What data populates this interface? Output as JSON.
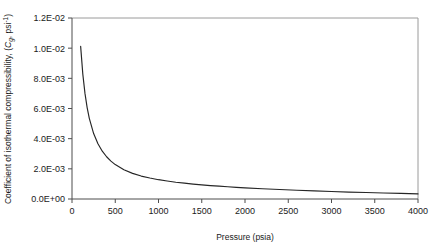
{
  "chart_data": {
    "type": "line",
    "title": "",
    "xlabel": "Pressure (psia)",
    "ylabel_text": "Coefficient of isothermal compressibility, (",
    "ylabel_symbol": "C",
    "ylabel_symbol_sub": "g",
    "ylabel_unit": ", psi",
    "ylabel_unit_exp": "-1",
    "ylabel_close": ")",
    "xlim": [
      0,
      4000
    ],
    "ylim": [
      0,
      0.012
    ],
    "xticks": [
      0,
      500,
      1000,
      1500,
      2000,
      2500,
      3000,
      3500,
      4000
    ],
    "xtick_labels": [
      "0",
      "500",
      "1000",
      "1500",
      "2000",
      "2500",
      "3000",
      "3500",
      "4000"
    ],
    "yticks": [
      0,
      0.002,
      0.004,
      0.006,
      0.008,
      0.01,
      0.012
    ],
    "ytick_labels": [
      "0.0E+00",
      "2.0E-03",
      "4.0E-03",
      "6.0E-03",
      "8.0E-03",
      "1.0E-02",
      "1.2E-02"
    ],
    "grid": false,
    "legend": false,
    "series": [
      {
        "name": "Isothermal compressibility",
        "color": "#262626",
        "x": [
          100,
          125,
          150,
          175,
          200,
          250,
          300,
          350,
          400,
          450,
          500,
          600,
          700,
          800,
          900,
          1000,
          1100,
          1200,
          1300,
          1400,
          1500,
          1600,
          1700,
          1800,
          1900,
          2000,
          2200,
          2400,
          2600,
          2800,
          3000,
          3200,
          3400,
          3600,
          3800,
          4000
        ],
        "y": [
          0.01012,
          0.00828,
          0.007,
          0.00606,
          0.00535,
          0.00434,
          0.00366,
          0.00317,
          0.0028,
          0.00251,
          0.00228,
          0.00194,
          0.0017,
          0.00152,
          0.00139,
          0.00128,
          0.00119,
          0.00111,
          0.00105,
          0.00099,
          0.00094,
          0.00089,
          0.00085,
          0.00081,
          0.00077,
          0.00074,
          0.00068,
          0.00063,
          0.00058,
          0.00054,
          0.0005,
          0.00046,
          0.00043,
          0.0004,
          0.00037,
          0.00034
        ]
      }
    ]
  },
  "colors": {
    "curve": "#262626",
    "axis": "#4d4d4d",
    "frame": "#9a9a9a",
    "background": "#ffffff"
  }
}
